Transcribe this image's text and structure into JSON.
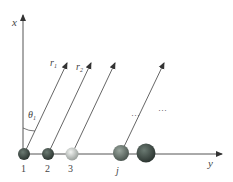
{
  "diagram": {
    "axes": {
      "vertical_label": "x",
      "horizontal_label": "y"
    },
    "rays": [
      {
        "label": "r",
        "subscript": "1"
      },
      {
        "label": "r",
        "subscript": "2"
      }
    ],
    "angle": {
      "label": "θ",
      "subscript": "1"
    },
    "ellipses": [
      "···",
      "···"
    ],
    "particles": [
      {
        "label": "1",
        "color": "#3d4a44"
      },
      {
        "label": "2",
        "color": "#3b4842"
      },
      {
        "label": "3",
        "color": "#c8ccc8"
      },
      {
        "label": "j",
        "color": "#68756d"
      },
      {
        "label": "",
        "color": "#3f4a45"
      }
    ]
  }
}
